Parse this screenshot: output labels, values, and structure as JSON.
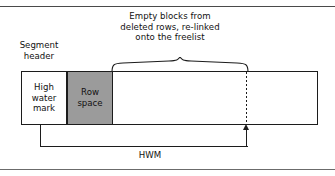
{
  "figure": {
    "title_caption": {
      "line1": "Empty blocks from",
      "line2": "deleted rows, re-linked",
      "line3": "onto the freelist"
    },
    "segment_header_label": {
      "line1": "Segment",
      "line2": "header"
    },
    "cells": {
      "high_water_mark": {
        "line1": "High",
        "line2": "water",
        "line3": "mark",
        "fill": "#ffffff"
      },
      "row_space": {
        "line1": "Row",
        "line2": "space",
        "fill": "#9b9b9b"
      },
      "free_space": {
        "label": "",
        "fill": "#ffffff"
      }
    },
    "dimension": {
      "hwm_label": "HWM"
    },
    "colors": {
      "stroke": "#1c1c1c",
      "row_space_fill": "#9b9b9b",
      "page_rule": "#4a4a4a",
      "text": "#111111"
    }
  }
}
